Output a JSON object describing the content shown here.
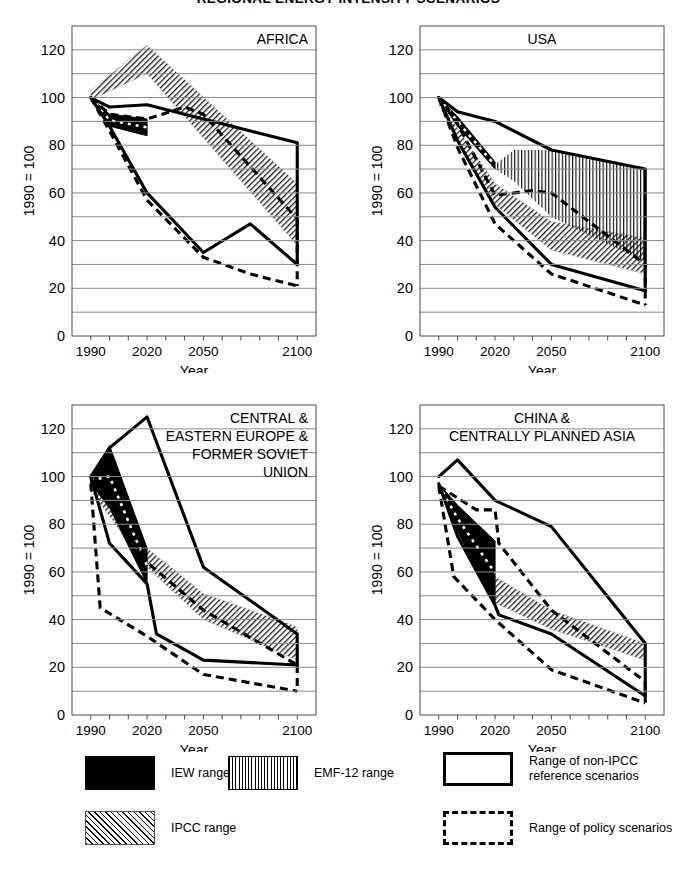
{
  "figure": {
    "title": "REGIONAL ENERGY INTENSITY SCENARIOS",
    "ylabel": "1990 = 100",
    "xlabel": "Year"
  },
  "legend": {
    "items": [
      {
        "key": "iew",
        "label": "IEW range",
        "style": "solid-black-fill"
      },
      {
        "key": "emf",
        "label": "EMF-12 range",
        "style": "vertical-hatch"
      },
      {
        "key": "ipcc",
        "label": "IPCC range",
        "style": "diagonal-hatch"
      },
      {
        "key": "ref",
        "label": "Range of non-IPCC\nreference scenarios",
        "style": "solid-outline"
      },
      {
        "key": "pol",
        "label": "Range of policy scenarios",
        "style": "dashed-outline"
      }
    ]
  },
  "chart_data": {
    "type": "line",
    "title": "REGIONAL ENERGY INTENSITY SCENARIOS",
    "xlabel": "Year",
    "ylabel": "1990 = 100",
    "xlim": [
      1980,
      2110
    ],
    "ylim": [
      0,
      130
    ],
    "xticks": [
      1990,
      2000,
      2010,
      2020,
      2030,
      2040,
      2050,
      2060,
      2070,
      2080,
      2090,
      2100
    ],
    "xticklabels": [
      "1990",
      "",
      "",
      "2020",
      "",
      "",
      "2050",
      "",
      "",
      "",
      "",
      "2100"
    ],
    "yticks": [
      0,
      10,
      20,
      30,
      40,
      50,
      60,
      70,
      80,
      90,
      100,
      110,
      120
    ],
    "yticklabels": [
      "0",
      "",
      "20",
      "",
      "40",
      "",
      "60",
      "",
      "80",
      "",
      "100",
      "",
      "120"
    ],
    "grid": true,
    "legend_position": "below",
    "panels": [
      {
        "name": "africa",
        "label": "AFRICA",
        "label_align": "right",
        "series": [
          {
            "name": "Range of non-IPCC reference scenarios (upper)",
            "style": "solid",
            "x": [
              1990,
              2000,
              2020,
              2050,
              2100
            ],
            "y": [
              100,
              96,
              97,
              91,
              81
            ]
          },
          {
            "name": "Range of non-IPCC reference scenarios (lower)",
            "style": "solid",
            "x": [
              1990,
              2000,
              2020,
              2050,
              2075,
              2100
            ],
            "y": [
              100,
              88,
              60,
              35,
              47,
              30
            ]
          },
          {
            "name": "Range of policy scenarios (upper)",
            "style": "dashed",
            "x": [
              1990,
              2000,
              2020,
              2040,
              2050,
              2100
            ],
            "y": [
              100,
              93,
              91,
              96,
              93,
              49
            ]
          },
          {
            "name": "Range of policy scenarios (lower)",
            "style": "dashed",
            "x": [
              1990,
              2000,
              2020,
              2050,
              2075,
              2100
            ],
            "y": [
              100,
              86,
              57,
              33,
              26,
              21
            ]
          },
          {
            "name": "IPCC range (upper)",
            "style": "diagonal-hatch-band",
            "x": [
              1990,
              2020,
              2100
            ],
            "y": [
              103,
              122,
              64
            ]
          },
          {
            "name": "IPCC range (lower)",
            "style": "diagonal-hatch-band",
            "x": [
              1990,
              2020,
              2100
            ],
            "y": [
              99,
              110,
              38
            ]
          },
          {
            "name": "IEW range (upper)",
            "style": "black-fill",
            "x": [
              1990,
              2000,
              2020
            ],
            "y": [
              100,
              93,
              91
            ]
          },
          {
            "name": "IEW range (lower)",
            "style": "black-fill",
            "x": [
              1990,
              2000,
              2020
            ],
            "y": [
              100,
              88,
              84
            ]
          }
        ]
      },
      {
        "name": "usa",
        "label": "USA",
        "label_align": "center",
        "series": [
          {
            "name": "Range of non-IPCC reference scenarios (upper)",
            "style": "solid",
            "x": [
              1990,
              2000,
              2020,
              2050,
              2100
            ],
            "y": [
              100,
              94,
              90,
              78,
              70
            ]
          },
          {
            "name": "Range of non-IPCC reference scenarios (lower)",
            "style": "solid",
            "x": [
              1990,
              2000,
              2020,
              2050,
              2100
            ],
            "y": [
              100,
              82,
              54,
              30,
              19
            ]
          },
          {
            "name": "Range of policy scenarios (upper)",
            "style": "dashed",
            "x": [
              1990,
              2000,
              2020,
              2040,
              2050,
              2100
            ],
            "y": [
              100,
              89,
              59,
              61,
              60,
              30
            ]
          },
          {
            "name": "Range of policy scenarios (lower)",
            "style": "dashed",
            "x": [
              1990,
              2000,
              2020,
              2050,
              2100
            ],
            "y": [
              100,
              79,
              47,
              26,
              13
            ]
          },
          {
            "name": "IPCC range (upper)",
            "style": "diagonal-hatch-band",
            "x": [
              1990,
              2020,
              2050,
              2100
            ],
            "y": [
              99,
              64,
              48,
              41
            ]
          },
          {
            "name": "IPCC range (lower)",
            "style": "diagonal-hatch-band",
            "x": [
              1990,
              2020,
              2050,
              2100
            ],
            "y": [
              97,
              55,
              36,
              26
            ]
          },
          {
            "name": "EMF-12 range (upper)",
            "style": "vertical-hatch-band",
            "x": [
              2020,
              2030,
              2050,
              2100
            ],
            "y": [
              72,
              78,
              78,
              70
            ]
          },
          {
            "name": "EMF-12 range (lower)",
            "style": "vertical-hatch-band",
            "x": [
              2020,
              2030,
              2050,
              2100
            ],
            "y": [
              70,
              65,
              50,
              31
            ]
          },
          {
            "name": "IEW range (upper)",
            "style": "black-fill",
            "x": [
              1990,
              2000,
              2020
            ],
            "y": [
              100,
              92,
              73
            ]
          },
          {
            "name": "IEW range (lower)",
            "style": "black-fill",
            "x": [
              1990,
              2000,
              2020
            ],
            "y": [
              100,
              88,
              70
            ]
          }
        ]
      },
      {
        "name": "central-eastern-europe-fsu",
        "label": "CENTRAL &\nEASTERN EUROPE &\nFORMER SOVIET\nUNION",
        "label_align": "right",
        "series": [
          {
            "name": "Range of non-IPCC reference scenarios (upper)",
            "style": "solid",
            "x": [
              1990,
              2000,
              2020,
              2050,
              2100
            ],
            "y": [
              100,
              112,
              125,
              62,
              34
            ]
          },
          {
            "name": "Range of non-IPCC reference scenarios (lower)",
            "style": "solid",
            "x": [
              1990,
              2000,
              2020,
              2025,
              2050,
              2100
            ],
            "y": [
              100,
              72,
              55,
              34,
              23,
              21
            ]
          },
          {
            "name": "Range of policy scenarios (upper)",
            "style": "dashed",
            "x": [
              1990,
              2020,
              2050,
              2100
            ],
            "y": [
              99,
              64,
              44,
              21
            ]
          },
          {
            "name": "Range of policy scenarios (lower)",
            "style": "dashed",
            "x": [
              1990,
              1995,
              2020,
              2050,
              2100
            ],
            "y": [
              97,
              45,
              33,
              17,
              10
            ]
          },
          {
            "name": "IPCC range (upper)",
            "style": "diagonal-hatch-band",
            "x": [
              1990,
              2020,
              2050,
              2100
            ],
            "y": [
              98,
              70,
              51,
              37
            ]
          },
          {
            "name": "IPCC range (lower)",
            "style": "diagonal-hatch-band",
            "x": [
              1990,
              2020,
              2050,
              2100
            ],
            "y": [
              94,
              62,
              40,
              23
            ]
          },
          {
            "name": "IEW range (upper)",
            "style": "black-fill",
            "x": [
              1990,
              2000,
              2020
            ],
            "y": [
              100,
              113,
              70
            ]
          },
          {
            "name": "IEW range (lower)",
            "style": "black-fill",
            "x": [
              1990,
              2000,
              2020
            ],
            "y": [
              97,
              87,
              55
            ]
          }
        ]
      },
      {
        "name": "china-centrally-planned-asia",
        "label": "CHINA &\nCENTRALLY PLANNED ASIA",
        "label_align": "center",
        "series": [
          {
            "name": "Range of non-IPCC reference scenarios (upper)",
            "style": "solid",
            "x": [
              1990,
              2000,
              2020,
              2050,
              2100
            ],
            "y": [
              100,
              107,
              90,
              79,
              30
            ]
          },
          {
            "name": "Range of non-IPCC reference scenarios (lower)",
            "style": "solid",
            "x": [
              1990,
              2000,
              2020,
              2022,
              2050,
              2100
            ],
            "y": [
              97,
              75,
              46,
              42,
              34,
              8
            ]
          },
          {
            "name": "Range of policy scenarios (upper)",
            "style": "dashed",
            "x": [
              1990,
              2010,
              2020,
              2022,
              2050,
              2100
            ],
            "y": [
              96,
              86,
              86,
              72,
              44,
              14
            ]
          },
          {
            "name": "Range of policy scenarios (lower)",
            "style": "dashed",
            "x": [
              1990,
              1998,
              2020,
              2050,
              2100
            ],
            "y": [
              96,
              58,
              40,
              19,
              5
            ]
          },
          {
            "name": "IPCC range (upper)",
            "style": "diagonal-hatch-band",
            "x": [
              2020,
              2050,
              2100
            ],
            "y": [
              58,
              44,
              30
            ]
          },
          {
            "name": "IPCC range (lower)",
            "style": "diagonal-hatch-band",
            "x": [
              2020,
              2050,
              2100
            ],
            "y": [
              47,
              36,
              23
            ]
          },
          {
            "name": "IEW range (upper)",
            "style": "black-fill",
            "x": [
              1990,
              2000,
              2020
            ],
            "y": [
              97,
              88,
              73
            ]
          },
          {
            "name": "IEW range (lower)",
            "style": "black-fill",
            "x": [
              1990,
              2000,
              2020
            ],
            "y": [
              96,
              77,
              46
            ]
          }
        ]
      }
    ]
  }
}
